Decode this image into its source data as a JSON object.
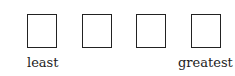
{
  "boxes": [
    {
      "id": 1,
      "value": ""
    },
    {
      "id": 2,
      "value": ""
    },
    {
      "id": 3,
      "value": ""
    },
    {
      "id": 4,
      "value": ""
    }
  ],
  "labels": {
    "left": "least",
    "right": "greatest"
  }
}
